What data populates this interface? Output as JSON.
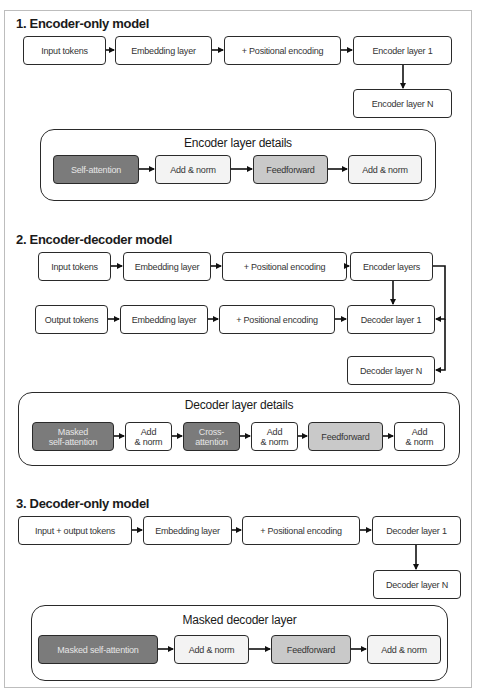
{
  "sections": {
    "encoder_only": {
      "title": "1. Encoder-only model",
      "flow": [
        "Input tokens",
        "Embedding layer",
        "+ Positional encoding",
        "Encoder layer 1"
      ],
      "last": "Encoder layer N",
      "details": {
        "title": "Encoder layer details",
        "blocks": [
          "Self-attention",
          "Add & norm",
          "Feedforward",
          "Add & norm"
        ]
      }
    },
    "encoder_decoder": {
      "title": "2. Encoder-decoder model",
      "encoder_flow": [
        "Input tokens",
        "Embedding layer",
        "+ Positional encoding",
        "Encoder layers"
      ],
      "decoder_flow": [
        "Output tokens",
        "Embedding layer",
        "+ Positional encoding",
        "Decoder layer 1"
      ],
      "last": "Decoder layer N",
      "details": {
        "title": "Decoder layer details",
        "blocks": [
          "Masked self-attention",
          "Add & norm",
          "Cross-attention",
          "Add & norm",
          "Feedforward",
          "Add & norm"
        ],
        "block_lines": [
          [
            "Masked",
            "self-attention"
          ],
          [
            "Add",
            "& norm"
          ],
          [
            "Cross-",
            "attention"
          ],
          [
            "Add",
            "& norm"
          ],
          [
            "Feedforward"
          ],
          [
            "Add",
            "& norm"
          ]
        ]
      }
    },
    "decoder_only": {
      "title": "3. Decoder-only model",
      "flow": [
        "Input + output tokens",
        "Embedding layer",
        "+ Positional encoding",
        "Decoder layer 1"
      ],
      "last": "Decoder layer N",
      "details": {
        "title": "Masked decoder layer",
        "blocks": [
          "Masked self-attention",
          "Add & norm",
          "Feedforward",
          "Add & norm"
        ]
      }
    }
  },
  "colors": {
    "attention_fill": "#7b7b7b",
    "feedforward_fill": "#c9c9c9",
    "addnorm_fill": "#f3f3f3",
    "stroke": "#2a2a2a"
  }
}
